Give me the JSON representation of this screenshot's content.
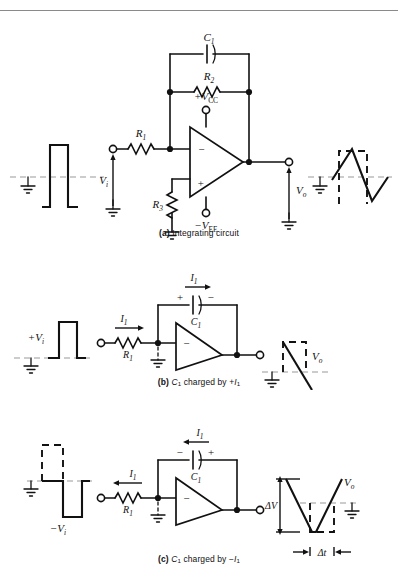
{
  "figure": {
    "type": "circuit-schematic",
    "panel_count": 3
  },
  "panels": [
    {
      "id": "a",
      "caption_tag": "(a)",
      "caption_text": "Integrating circuit",
      "input_waveform": {
        "kind": "square-pulse",
        "style": "solid",
        "polarity": "positive",
        "baseline_label": "ground"
      },
      "output_waveform": {
        "kind": "triangle",
        "style": "solid",
        "reference_overlay": "dashed square wave",
        "baseline_label": "ground"
      },
      "labels": {
        "cap": "C",
        "cap_sub": "1",
        "res_fb": "R",
        "res_fb_sub": "2",
        "res_in": "R",
        "res_in_sub": "1",
        "res_bias": "R",
        "res_bias_sub": "3",
        "vcc": "+V",
        "vcc_sub": "CC",
        "vee": "−V",
        "vee_sub": "EE",
        "vin": "V",
        "vin_sub": "i",
        "vout": "V",
        "vout_sub": "o",
        "inv_input": "−",
        "noninv_input": "+"
      }
    },
    {
      "id": "b",
      "caption_tag": "(b)",
      "caption_text_parts": [
        "C",
        "1",
        " charged by +",
        "I",
        "1"
      ],
      "input_waveform": {
        "kind": "square-pulse",
        "style": "solid",
        "polarity": "positive"
      },
      "output_waveform": {
        "kind": "ramp",
        "direction": "falling",
        "style": "solid",
        "reference_overlay": "dashed square pulse"
      },
      "labels": {
        "vin": "+V",
        "vin_sub": "i",
        "current": "I",
        "current_sub": "1",
        "current_direction": "right",
        "res_in": "R",
        "res_in_sub": "1",
        "cap": "C",
        "cap_sub": "1",
        "cap_left_polarity": "+",
        "cap_right_polarity": "−",
        "vout": "V",
        "vout_sub": "o",
        "inv_input": "−"
      }
    },
    {
      "id": "c",
      "caption_tag": "(c)",
      "caption_text_parts": [
        "C",
        "1",
        " charged by −",
        "I",
        "1"
      ],
      "input_waveform": {
        "kind": "square-pulse",
        "style": "solid",
        "polarity": "negative",
        "reference_overlay": "dashed positive pulse"
      },
      "output_waveform": {
        "kind": "ramp",
        "direction": "rising",
        "style": "solid",
        "reference_overlay": "dashed square pulse"
      },
      "labels": {
        "vin": "−V",
        "vin_sub": "i",
        "current": "I",
        "current_sub": "1",
        "current_direction": "left",
        "res_in": "R",
        "res_in_sub": "1",
        "cap": "C",
        "cap_sub": "1",
        "cap_left_polarity": "−",
        "cap_right_polarity": "+",
        "vout": "V",
        "vout_sub": "o",
        "delta_v": "ΔV",
        "delta_t": "Δt",
        "inv_input": "−"
      }
    }
  ],
  "colors": {
    "ink": "#111111",
    "background": "#ffffff",
    "axis_dash": "#9a9a9a",
    "rule": "#8a8a8a"
  }
}
